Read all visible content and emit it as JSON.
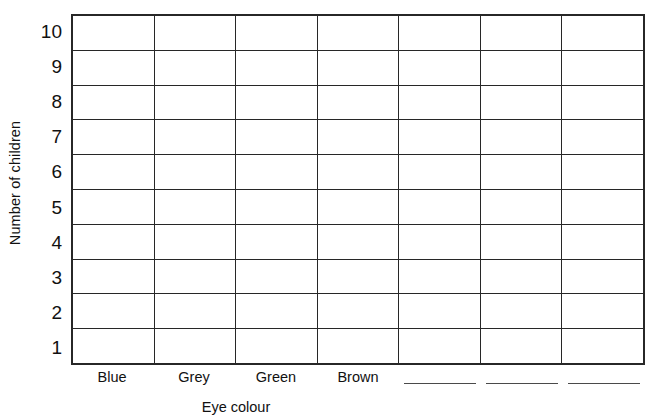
{
  "worksheet": {
    "y_axis_title": "Number of children",
    "x_axis_title": "Eye colour"
  },
  "chart_data": {
    "type": "bar",
    "title": "",
    "xlabel": "Eye colour",
    "ylabel": "Number of children",
    "categories": [
      "Blue",
      "Grey",
      "Green",
      "Brown",
      "",
      "",
      ""
    ],
    "values": [
      0,
      0,
      0,
      0,
      0,
      0,
      0
    ],
    "ylim": [
      0,
      10
    ],
    "yticks": [
      "1",
      "2",
      "3",
      "4",
      "5",
      "6",
      "7",
      "8",
      "9",
      "10"
    ],
    "yticks_descending": [
      "10",
      "9",
      "8",
      "7",
      "6",
      "5",
      "4",
      "3",
      "2",
      "1"
    ],
    "grid": true,
    "grid_rows": 10,
    "grid_columns": 7,
    "legend": "none",
    "blank_category_count": 3,
    "note": "empty tally/bar chart grid for recording data"
  },
  "colors": {
    "grid_line": "#272727",
    "blank_line": "#4a4a4a",
    "text": "#111111",
    "background": "#ffffff"
  }
}
